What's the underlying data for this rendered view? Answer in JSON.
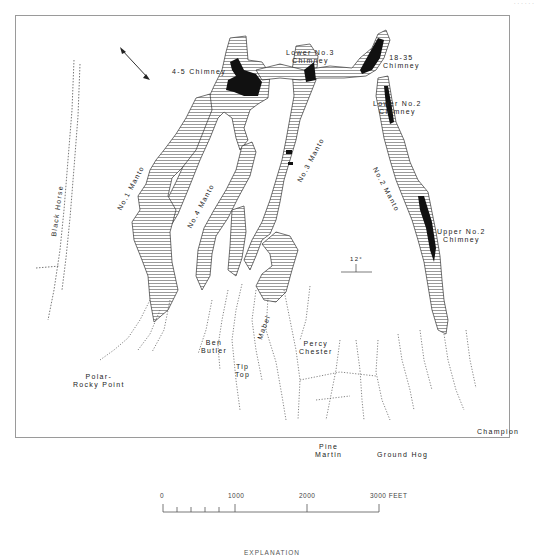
{
  "page": {
    "header_fragment": "· · · · · ·"
  },
  "map": {
    "north_arrow": {
      "label": "N"
    },
    "declination": {
      "label": "12°"
    },
    "labels": {
      "chimney_45": "4-5 Chimney",
      "lower_no3": [
        "Lower No.3",
        "Chimney"
      ],
      "chimney_1835": [
        "18-35",
        "Chimney"
      ],
      "lower_no2": [
        "Lower No.2",
        "Chimney"
      ],
      "upper_no2": [
        "Upper No.2",
        "Chimney"
      ],
      "no1_manto": "No.1 Manto",
      "no4_manto": "No.4 Manto",
      "no3_manto": "No.3 Manto",
      "no2_manto": "No.2 Manto",
      "black_horse": "Black Horse",
      "ben_butler": [
        "Ben",
        "Butler"
      ],
      "tip_top": [
        "Tip",
        "Top"
      ],
      "mabel": "Mabel",
      "percy_chester": [
        "Percy",
        "Chester"
      ],
      "polar_rocky_point": [
        "Polar-",
        "Rocky Point"
      ],
      "pine_martin": [
        "Pine",
        "Martin"
      ],
      "ground_hog": "Ground Hog",
      "champion": "Champion"
    }
  },
  "scale_bar": {
    "ticks": [
      "0",
      "1000",
      "2000",
      "3000 FEET"
    ]
  },
  "explanation": {
    "title": "EXPLANATION"
  }
}
